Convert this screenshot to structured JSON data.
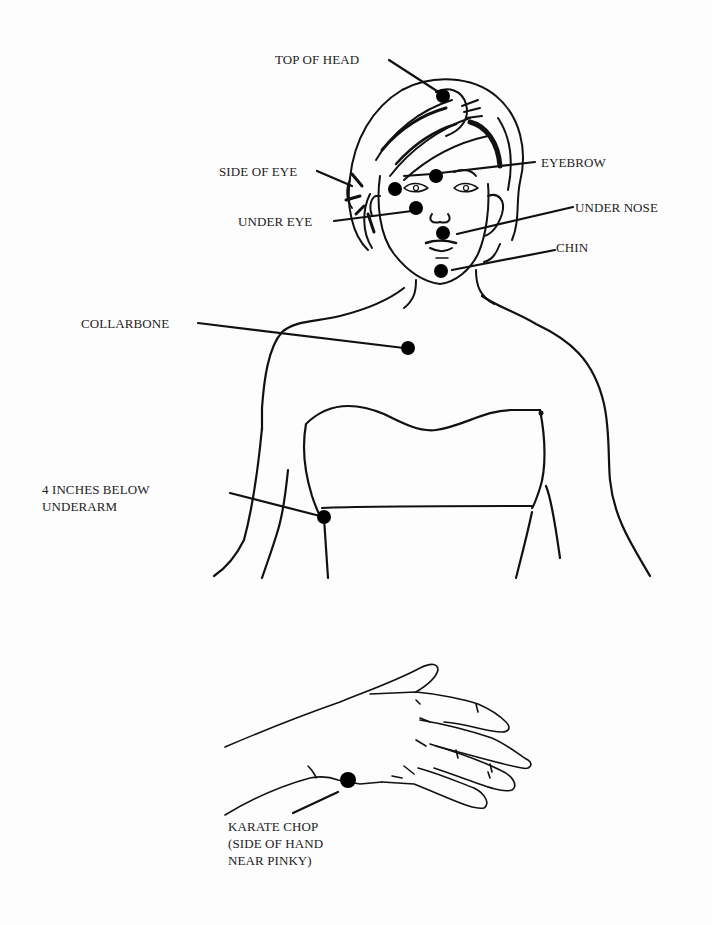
{
  "diagram": {
    "title": "",
    "figures": [
      "upper-body-front",
      "hand-side-view"
    ],
    "colors": {
      "ink": "#111111",
      "background": "#fdfdfd",
      "label": "#222222"
    },
    "points": [
      {
        "id": "top-of-head",
        "label": "TOP OF HEAD",
        "x": 443,
        "y": 96
      },
      {
        "id": "eyebrow",
        "label": "EYEBROW",
        "x": 436,
        "y": 176
      },
      {
        "id": "side-of-eye",
        "label": "SIDE OF EYE",
        "x": 395,
        "y": 189
      },
      {
        "id": "under-eye",
        "label": "UNDER EYE",
        "x": 416,
        "y": 208
      },
      {
        "id": "under-nose",
        "label": "UNDER NOSE",
        "x": 443,
        "y": 233
      },
      {
        "id": "chin",
        "label": "CHIN",
        "x": 441,
        "y": 271
      },
      {
        "id": "collarbone",
        "label": "COLLARBONE",
        "x": 408,
        "y": 348
      },
      {
        "id": "under-arm",
        "label_line1": "4 INCHES BELOW",
        "label_line2": "UNDERARM",
        "x": 324,
        "y": 517
      },
      {
        "id": "karate-chop",
        "label_line1": "KARATE CHOP",
        "label_line2": "(SIDE OF HAND",
        "label_line3": "NEAR PINKY)",
        "x": 348,
        "y": 780
      }
    ]
  }
}
